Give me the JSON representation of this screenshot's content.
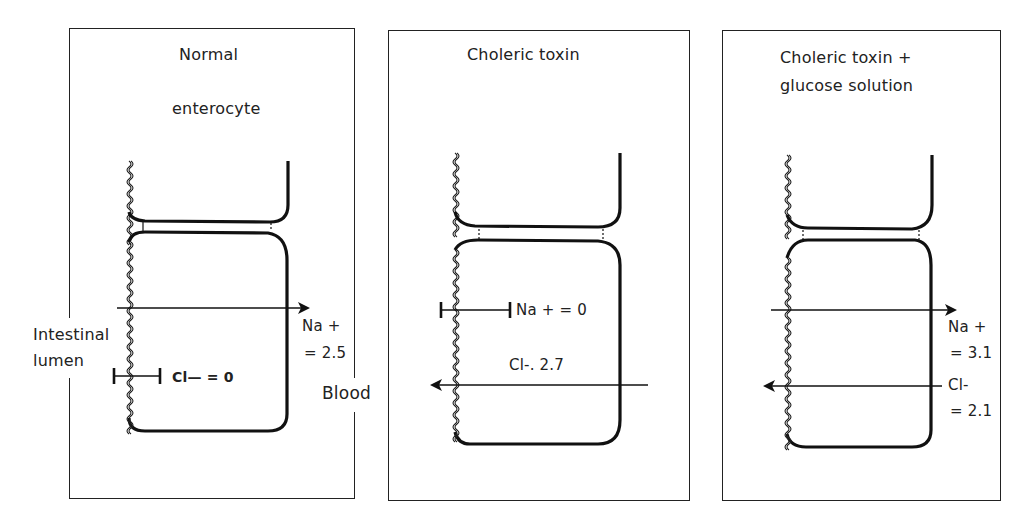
{
  "figure": {
    "panels": [
      {
        "id": "normal",
        "title_lines": [
          "Normal",
          "enterocyte"
        ],
        "na_label": [
          "Na +",
          "= 2.5"
        ],
        "cl_label": "Cl— = 0",
        "na_flux": 2.5,
        "cl_flux": 0,
        "na_direction": "lumen-to-blood",
        "cl_direction": "blocked"
      },
      {
        "id": "choleric-toxin",
        "title_lines": [
          "Choleric toxin"
        ],
        "na_label": "Na + = 0",
        "cl_label": "Cl-. 2.7",
        "na_flux": 0,
        "cl_flux": 2.7,
        "na_direction": "blocked",
        "cl_direction": "blood-to-lumen"
      },
      {
        "id": "choleric-toxin-glucose",
        "title_lines": [
          "Choleric toxin  +",
          "glucose solution"
        ],
        "na_label": [
          "Na +",
          "= 3.1"
        ],
        "cl_label": [
          "Cl-",
          "= 2.1"
        ],
        "na_flux": 3.1,
        "cl_flux": 2.1,
        "na_direction": "lumen-to-blood",
        "cl_direction": "blood-to-lumen"
      }
    ],
    "side_labels": {
      "lumen": [
        "Intestinal",
        "lumen"
      ],
      "blood": "Blood"
    },
    "colors": {
      "line": "#111111",
      "background": "#ffffff",
      "frame": "#222222"
    }
  }
}
